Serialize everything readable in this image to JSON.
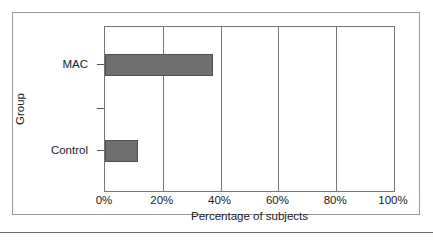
{
  "figure": {
    "frame_color": "#9a9a9a",
    "background": "#ffffff",
    "rule_color": "#6b6b6b"
  },
  "axes": {
    "x_title": "Percentage of subjects",
    "y_title": "Group",
    "x_ticks": [
      "0%",
      "20%",
      "40%",
      "60%",
      "80%",
      "100%"
    ],
    "y_categories": [
      "MAC",
      "Control"
    ],
    "bar_color": "#6f6f6f",
    "bar_border_color": "#4f4f4f",
    "grid_color": "#767676"
  },
  "chart_data": {
    "type": "bar",
    "orientation": "horizontal",
    "title": "",
    "subtitle": "",
    "xlabel": "Percentage of subjects",
    "ylabel": "Group",
    "categories": [
      "MAC",
      "Control"
    ],
    "values": [
      37.5,
      11.5
    ],
    "value_labels": [
      "37.5%",
      "11.5%"
    ],
    "xlim": [
      0,
      100
    ],
    "xticks": [
      0,
      20,
      40,
      60,
      80,
      100
    ],
    "xtick_labels": [
      "0%",
      "20%",
      "40%",
      "60%",
      "80%",
      "100%"
    ],
    "grid": "vertical",
    "gridline_values": [
      20,
      40,
      60,
      80
    ],
    "legend": null,
    "legend_position": "none",
    "series": [
      {
        "name": "Percentage of subjects",
        "color": "#6f6f6f",
        "values": [
          37.5,
          11.5
        ]
      }
    ],
    "annotations": []
  }
}
